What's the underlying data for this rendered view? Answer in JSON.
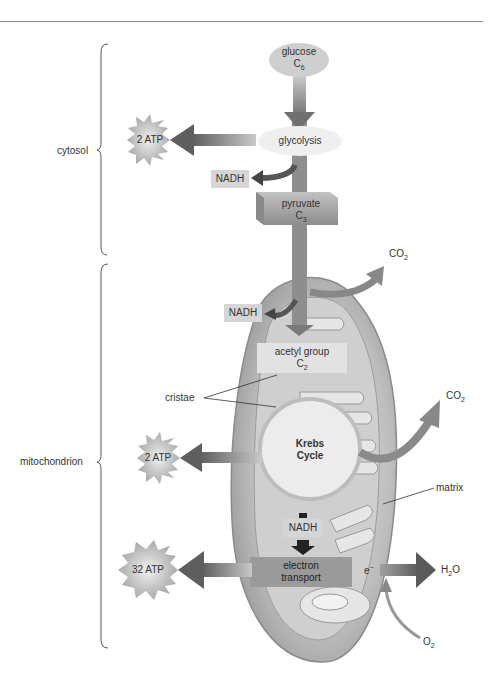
{
  "diagram": {
    "regions": {
      "cytosol": "cytosol",
      "mitochondrion": "mitochondrion"
    },
    "nodes": {
      "glucose": {
        "name": "glucose",
        "formula": "C",
        "sub": "6"
      },
      "glycolysis": "glycolysis",
      "pyruvate": {
        "name": "pyruvate",
        "formula": "C",
        "sub": "3"
      },
      "acetyl": {
        "name": "acetyl group",
        "formula": "C",
        "sub": "2"
      },
      "krebs_line1": "Krebs",
      "krebs_line2": "Cycle",
      "electron_line1": "electron",
      "electron_line2": "transport"
    },
    "outputs": {
      "atp_glycolysis": "2 ATP",
      "atp_krebs": "2 ATP",
      "atp_electron": "32 ATP",
      "nadh_glycolysis": "NADH",
      "nadh_acetyl": "NADH",
      "nadh_krebs": "NADH",
      "co2_1": {
        "base": "CO",
        "sub": "2"
      },
      "co2_2": {
        "base": "CO",
        "sub": "2"
      },
      "h2o": {
        "pre": "H",
        "sub": "2",
        "post": "O"
      },
      "o2": {
        "base": "O",
        "sub": "2"
      },
      "electron": "e",
      "electron_sup": "−"
    },
    "annotations": {
      "cristae": "cristae",
      "matrix": "matrix"
    }
  }
}
